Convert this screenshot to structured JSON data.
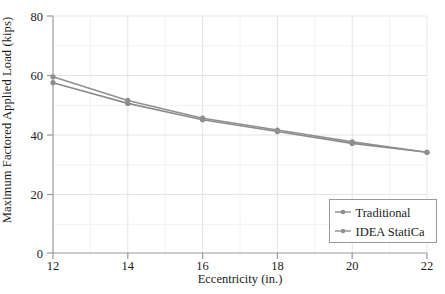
{
  "chart_data": {
    "type": "line",
    "title": "",
    "subtitle": "",
    "xlabel": "Eccentricity (in.)",
    "ylabel": "Maximum Factored Applied Load (kips)",
    "x": [
      12,
      14,
      16,
      18,
      20,
      22
    ],
    "xlim": [
      12,
      22
    ],
    "ylim": [
      0,
      80
    ],
    "xticks": [
      "12",
      "14",
      "16",
      "18",
      "20",
      "22"
    ],
    "yticks": [
      "0",
      "20",
      "40",
      "60",
      "80"
    ],
    "grid": true,
    "legend_position": "lower-right",
    "series": [
      {
        "name": "Traditional",
        "color": "#8c8c8c",
        "marker": "circle",
        "values": [
          57.5,
          50.5,
          45.0,
          41.0,
          37.0,
          34.0
        ]
      },
      {
        "name": "IDEA StatiCa",
        "color": "#909090",
        "marker": "circle",
        "values": [
          59.5,
          51.5,
          45.5,
          41.5,
          37.5,
          34.0
        ]
      }
    ]
  },
  "axes": {
    "y_title": "Maximum Factored Applied Load (kips)",
    "x_title": "Eccentricity (in.)"
  },
  "legend": {
    "entries": [
      {
        "label": "Traditional"
      },
      {
        "label": "IDEA StatiCa"
      }
    ]
  },
  "colors": {
    "axis": "#8a8a8a",
    "grid": "#e2e2e2",
    "series_traditional": "#8c8c8c",
    "series_idea": "#909090",
    "text": "#1c1c1c",
    "legend_border": "#9a9a9a",
    "background": "#ffffff"
  }
}
